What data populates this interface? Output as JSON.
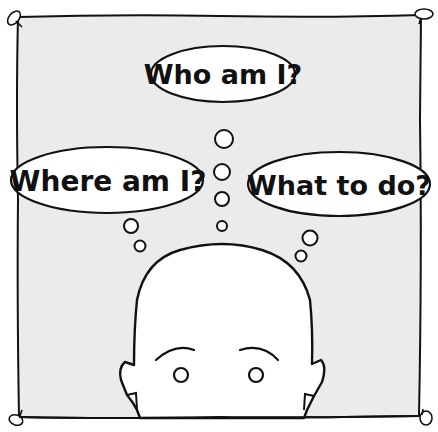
{
  "illustration": {
    "background_color": "#ffffff",
    "panel_color": "#ebebeb",
    "line_color": "#111111",
    "face_color": "#ffffff",
    "thought_bubbles": [
      {
        "id": "who",
        "text": "Who am I?"
      },
      {
        "id": "where",
        "text": "Where am I?"
      },
      {
        "id": "what",
        "text": "What to do?"
      }
    ]
  }
}
